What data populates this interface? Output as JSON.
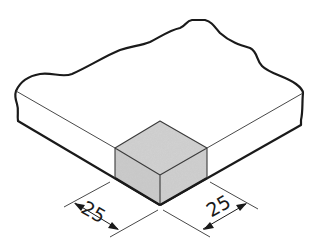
{
  "diagram": {
    "type": "isometric-technical-drawing",
    "colors": {
      "background": "#ffffff",
      "outline": "#1a1a1a",
      "block_fill": "#cfcfcf",
      "slab_fill": "#ffffff"
    },
    "dimensions": [
      {
        "id": "left",
        "label": "25"
      },
      {
        "id": "right",
        "label": "25"
      }
    ]
  }
}
